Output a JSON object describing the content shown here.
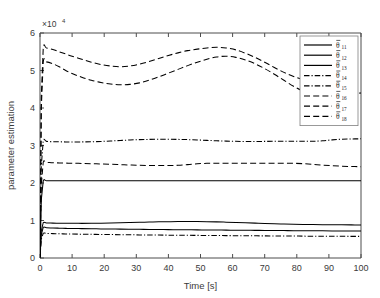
{
  "chart_data": {
    "type": "line",
    "title": "",
    "xlabel": "Time [s]",
    "ylabel": "parameter estimation",
    "y_exponent_label": "×10",
    "y_exponent_power": "4",
    "xlim": [
      0,
      100
    ],
    "ylim": [
      0,
      6
    ],
    "xticks": [
      0,
      10,
      20,
      30,
      40,
      50,
      60,
      70,
      80,
      90,
      100
    ],
    "xtick_labels": [
      "0",
      "10",
      "20",
      "30",
      "40",
      "50",
      "60",
      "70",
      "80",
      "90",
      "100"
    ],
    "yticks": [
      0,
      1,
      2,
      3,
      4,
      5,
      6
    ],
    "ytick_labels": [
      "0",
      "1",
      "2",
      "3",
      "4",
      "5",
      "6"
    ],
    "grid": false,
    "legend_position": "upper-right",
    "x": [
      0,
      0.4,
      1,
      2,
      4,
      6,
      8,
      10,
      13,
      16,
      19,
      22,
      25,
      28,
      31,
      34,
      37,
      40,
      43,
      46,
      49,
      52,
      55,
      58,
      61,
      64,
      67,
      70,
      73,
      76,
      79,
      82,
      85,
      88,
      91,
      94,
      97,
      100
    ],
    "series": [
      {
        "name": "theta_hat_11",
        "label": "θ",
        "sub": "11",
        "style": "solid",
        "values": [
          0.02,
          1.55,
          2.05,
          2.06,
          2.06,
          2.06,
          2.06,
          2.06,
          2.06,
          2.06,
          2.06,
          2.06,
          2.06,
          2.06,
          2.06,
          2.06,
          2.06,
          2.06,
          2.06,
          2.06,
          2.06,
          2.06,
          2.06,
          2.06,
          2.06,
          2.06,
          2.06,
          2.06,
          2.06,
          2.06,
          2.06,
          2.06,
          2.06,
          2.06,
          2.06,
          2.06,
          2.06,
          2.06
        ]
      },
      {
        "name": "theta_hat_12",
        "label": "θ",
        "sub": "12",
        "style": "solid",
        "values": [
          0.02,
          0.72,
          0.94,
          0.935,
          0.93,
          0.928,
          0.926,
          0.925,
          0.924,
          0.925,
          0.927,
          0.932,
          0.938,
          0.945,
          0.952,
          0.958,
          0.964,
          0.968,
          0.971,
          0.972,
          0.971,
          0.968,
          0.963,
          0.956,
          0.948,
          0.939,
          0.93,
          0.921,
          0.913,
          0.906,
          0.9,
          0.895,
          0.891,
          0.888,
          0.886,
          0.884,
          0.883,
          0.882
        ]
      },
      {
        "name": "theta_hat_13",
        "label": "θ",
        "sub": "13",
        "style": "solid",
        "values": [
          0.02,
          0.62,
          0.815,
          0.808,
          0.8,
          0.795,
          0.79,
          0.787,
          0.783,
          0.779,
          0.776,
          0.773,
          0.77,
          0.767,
          0.764,
          0.762,
          0.759,
          0.757,
          0.754,
          0.752,
          0.75,
          0.747,
          0.745,
          0.743,
          0.741,
          0.739,
          0.737,
          0.735,
          0.733,
          0.731,
          0.729,
          0.727,
          0.726,
          0.724,
          0.722,
          0.721,
          0.719,
          0.718
        ]
      },
      {
        "name": "theta_hat_14",
        "label": "θ",
        "sub": "14",
        "style": "dashdot",
        "values": [
          0.02,
          2.45,
          3.12,
          3.11,
          3.1,
          3.098,
          3.096,
          3.095,
          3.096,
          3.1,
          3.108,
          3.12,
          3.134,
          3.147,
          3.157,
          3.163,
          3.166,
          3.166,
          3.163,
          3.157,
          3.148,
          3.137,
          3.126,
          3.117,
          3.111,
          3.108,
          3.108,
          3.11,
          3.112,
          3.114,
          3.114,
          3.112,
          3.112,
          3.125,
          3.15,
          3.168,
          3.175,
          3.178
        ]
      },
      {
        "name": "theta_hat_15",
        "label": "θ",
        "sub": "15",
        "style": "dashdot",
        "values": [
          0.02,
          0.5,
          0.66,
          0.655,
          0.65,
          0.646,
          0.642,
          0.639,
          0.635,
          0.631,
          0.628,
          0.625,
          0.622,
          0.619,
          0.616,
          0.614,
          0.611,
          0.609,
          0.607,
          0.605,
          0.603,
          0.601,
          0.599,
          0.597,
          0.595,
          0.593,
          0.591,
          0.59,
          0.588,
          0.586,
          0.585,
          0.583,
          0.582,
          0.58,
          0.579,
          0.578,
          0.577,
          0.576
        ]
      },
      {
        "name": "theta_hat_16",
        "label": "θ",
        "sub": "16",
        "style": "dashed",
        "values": [
          0.02,
          4.3,
          5.58,
          5.6,
          5.56,
          5.5,
          5.44,
          5.38,
          5.3,
          5.22,
          5.16,
          5.12,
          5.1,
          5.12,
          5.17,
          5.24,
          5.32,
          5.4,
          5.47,
          5.53,
          5.57,
          5.6,
          5.62,
          5.6,
          5.55,
          5.46,
          5.35,
          5.22,
          5.08,
          4.95,
          4.84,
          4.76,
          4.73,
          4.76,
          4.82,
          4.86,
          4.87,
          4.86
        ]
      },
      {
        "name": "theta_hat_17",
        "label": "θ",
        "sub": "17",
        "style": "dashed",
        "values": [
          0.02,
          4.0,
          5.22,
          5.23,
          5.18,
          5.1,
          5.0,
          4.92,
          4.82,
          4.74,
          4.68,
          4.64,
          4.62,
          4.63,
          4.67,
          4.74,
          4.83,
          4.93,
          5.03,
          5.13,
          5.22,
          5.3,
          5.36,
          5.38,
          5.35,
          5.28,
          5.18,
          5.05,
          4.9,
          4.74,
          4.58,
          4.45,
          4.35,
          4.3,
          4.3,
          4.34,
          4.38,
          4.4
        ]
      },
      {
        "name": "theta_hat_18",
        "label": "θ",
        "sub": "18",
        "style": "dashed",
        "values": [
          0.02,
          1.95,
          2.55,
          2.55,
          2.54,
          2.535,
          2.53,
          2.528,
          2.522,
          2.515,
          2.508,
          2.5,
          2.49,
          2.48,
          2.472,
          2.468,
          2.466,
          2.466,
          2.472,
          2.49,
          2.512,
          2.525,
          2.528,
          2.528,
          2.527,
          2.526,
          2.526,
          2.527,
          2.528,
          2.528,
          2.525,
          2.515,
          2.498,
          2.478,
          2.46,
          2.448,
          2.44,
          2.435
        ]
      }
    ]
  },
  "legend": {
    "entries": [
      {
        "label": "θ",
        "sub": "11",
        "style": "solid"
      },
      {
        "label": "θ",
        "sub": "12",
        "style": "solid"
      },
      {
        "label": "θ",
        "sub": "13",
        "style": "solid"
      },
      {
        "label": "θ",
        "sub": "14",
        "style": "dashdot"
      },
      {
        "label": "θ",
        "sub": "15",
        "style": "dashdot"
      },
      {
        "label": "θ",
        "sub": "16",
        "style": "dashed"
      },
      {
        "label": "θ",
        "sub": "17",
        "style": "dashed"
      },
      {
        "label": "θ",
        "sub": "18",
        "style": "dashed"
      }
    ]
  }
}
